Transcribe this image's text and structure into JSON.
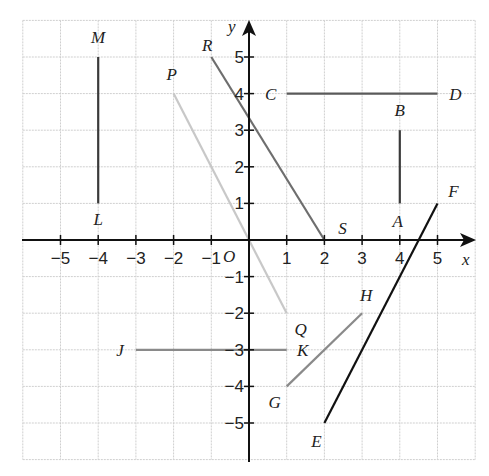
{
  "diagram": {
    "type": "coordinate-grid",
    "axes": {
      "x_label": "x",
      "y_label": "y",
      "origin_label": "O",
      "x_range": [
        -6,
        6
      ],
      "y_range": [
        -6,
        6
      ],
      "x_ticks": [
        {
          "value": -5,
          "label": "−5"
        },
        {
          "value": -4,
          "label": "−4"
        },
        {
          "value": -3,
          "label": "−3"
        },
        {
          "value": -2,
          "label": "−2"
        },
        {
          "value": -1,
          "label": "−1"
        },
        {
          "value": 1,
          "label": "1"
        },
        {
          "value": 2,
          "label": "2"
        },
        {
          "value": 3,
          "label": "3"
        },
        {
          "value": 4,
          "label": "4"
        },
        {
          "value": 5,
          "label": "5"
        }
      ],
      "y_ticks": [
        {
          "value": 5,
          "label": "5"
        },
        {
          "value": 4,
          "label": "4"
        },
        {
          "value": 3,
          "label": "3"
        },
        {
          "value": 2,
          "label": "2"
        },
        {
          "value": 1,
          "label": "1"
        },
        {
          "value": -1,
          "label": "−1"
        },
        {
          "value": -2,
          "label": "−2"
        },
        {
          "value": -3,
          "label": "−3"
        },
        {
          "value": -4,
          "label": "−4"
        },
        {
          "value": -5,
          "label": "−5"
        }
      ]
    },
    "segments": [
      {
        "name": "LM",
        "from": {
          "label": "L",
          "x": -4,
          "y": 1
        },
        "to": {
          "label": "M",
          "x": -4,
          "y": 5
        },
        "color": "#3a3a3a"
      },
      {
        "name": "PQ",
        "from": {
          "label": "P",
          "x": -2,
          "y": 4
        },
        "to": {
          "label": "Q",
          "x": 1,
          "y": -2
        },
        "color": "#c8c8c8"
      },
      {
        "name": "RS",
        "from": {
          "label": "R",
          "x": -1,
          "y": 5
        },
        "to": {
          "label": "S",
          "x": 2,
          "y": 0
        },
        "color": "#6e6e6e"
      },
      {
        "name": "CD",
        "from": {
          "label": "C",
          "x": 1,
          "y": 4
        },
        "to": {
          "label": "D",
          "x": 5,
          "y": 4
        },
        "color": "#5a5a5a"
      },
      {
        "name": "AB",
        "from": {
          "label": "A",
          "x": 4,
          "y": 1
        },
        "to": {
          "label": "B",
          "x": 4,
          "y": 3
        },
        "color": "#3a3a3a"
      },
      {
        "name": "EF",
        "from": {
          "label": "E",
          "x": 2,
          "y": -5
        },
        "to": {
          "label": "F",
          "x": 5,
          "y": 1
        },
        "color": "#111111"
      },
      {
        "name": "GH",
        "from": {
          "label": "G",
          "x": 1,
          "y": -4
        },
        "to": {
          "label": "H",
          "x": 3,
          "y": -2
        },
        "color": "#8a8a8a"
      },
      {
        "name": "JK",
        "from": {
          "label": "J",
          "x": -3,
          "y": -3
        },
        "to": {
          "label": "K",
          "x": 1,
          "y": -3
        },
        "color": "#8a8a8a"
      }
    ],
    "points": [
      {
        "label": "M",
        "x": -4,
        "y": 5
      },
      {
        "label": "L",
        "x": -4,
        "y": 1
      },
      {
        "label": "P",
        "x": -2,
        "y": 4
      },
      {
        "label": "Q",
        "x": 1,
        "y": -2
      },
      {
        "label": "R",
        "x": -1,
        "y": 5
      },
      {
        "label": "S",
        "x": 2,
        "y": 0
      },
      {
        "label": "C",
        "x": 1,
        "y": 4
      },
      {
        "label": "D",
        "x": 5,
        "y": 4
      },
      {
        "label": "B",
        "x": 4,
        "y": 3
      },
      {
        "label": "A",
        "x": 4,
        "y": 1
      },
      {
        "label": "F",
        "x": 5,
        "y": 1
      },
      {
        "label": "E",
        "x": 2,
        "y": -5
      },
      {
        "label": "H",
        "x": 3,
        "y": -2
      },
      {
        "label": "G",
        "x": 1,
        "y": -4
      },
      {
        "label": "K",
        "x": 1,
        "y": -3
      },
      {
        "label": "J",
        "x": -3,
        "y": -3
      }
    ]
  }
}
